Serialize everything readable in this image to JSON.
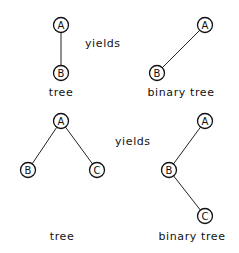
{
  "diagrams": [
    {
      "name": "example-1",
      "yields_label": "yields",
      "yields_pos": [
        85,
        47
      ],
      "tree": {
        "caption": "tree",
        "caption_pos": [
          61,
          96
        ],
        "nodes": [
          {
            "id": "A",
            "label": "A",
            "x": 61,
            "y": 25
          },
          {
            "id": "B",
            "label": "B",
            "x": 61,
            "y": 73
          }
        ],
        "edges": [
          [
            "A",
            "B"
          ]
        ]
      },
      "binary_tree": {
        "caption": "binary tree",
        "caption_pos": [
          181,
          96
        ],
        "nodes": [
          {
            "id": "A",
            "label": "A",
            "x": 205,
            "y": 25
          },
          {
            "id": "B",
            "label": "B",
            "x": 157,
            "y": 73
          }
        ],
        "edges": [
          [
            "A",
            "B"
          ]
        ]
      }
    },
    {
      "name": "example-2",
      "yields_label": "yields",
      "yields_pos": [
        115,
        145
      ],
      "tree": {
        "caption": "tree",
        "caption_pos": [
          62,
          240
        ],
        "nodes": [
          {
            "id": "A",
            "label": "A",
            "x": 61,
            "y": 121
          },
          {
            "id": "B",
            "label": "B",
            "x": 28,
            "y": 170
          },
          {
            "id": "C",
            "label": "C",
            "x": 97,
            "y": 170
          }
        ],
        "edges": [
          [
            "A",
            "B"
          ],
          [
            "A",
            "C"
          ]
        ]
      },
      "binary_tree": {
        "caption": "binary tree",
        "caption_pos": [
          192,
          240
        ],
        "nodes": [
          {
            "id": "A",
            "label": "A",
            "x": 205,
            "y": 121
          },
          {
            "id": "B",
            "label": "B",
            "x": 169,
            "y": 170
          },
          {
            "id": "C",
            "label": "C",
            "x": 205,
            "y": 216
          }
        ],
        "edges": [
          [
            "A",
            "B"
          ],
          [
            "B",
            "C"
          ]
        ]
      }
    }
  ],
  "node_radius": 7.5
}
